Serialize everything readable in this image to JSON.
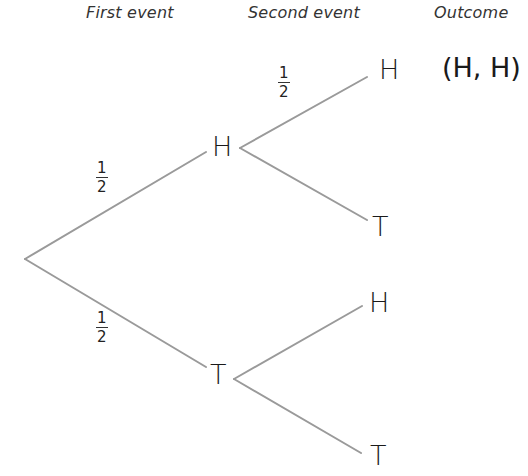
{
  "headers": {
    "first": "First event",
    "second": "Second event",
    "outcome": "Outcome"
  },
  "line_color": "#9a9a9a",
  "nodes": {
    "first_h": "H",
    "first_t": "T",
    "second_hh": "H",
    "second_ht": "T",
    "second_th": "H",
    "second_tt": "T"
  },
  "probabilities": {
    "root_to_h": {
      "num": "1",
      "den": "2"
    },
    "root_to_t": {
      "num": "1",
      "den": "2"
    },
    "h_to_h": {
      "num": "1",
      "den": "2"
    }
  },
  "outcomes": {
    "hh": "(H, H)"
  }
}
